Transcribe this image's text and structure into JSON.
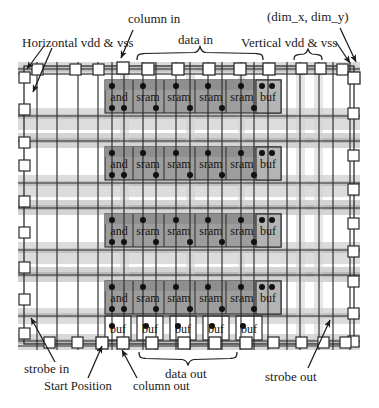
{
  "figure": {
    "kind": "vlsi-tile-array-floorplan",
    "title_visible": false
  },
  "labels": {
    "top_left": "Horizontal vdd & vss",
    "top_center": "column in",
    "top_center2": "data in",
    "top_right_coord": "(dim_x, dim_y)",
    "top_right": "Vertical vdd & vss",
    "bottom_left": "strobe in",
    "bottom_start_position": "Start Position",
    "bottom_column_out": "column out",
    "bottom_data_out": "data out",
    "bottom_right": "strobe out"
  },
  "cells": {
    "row_labels": [
      "and",
      "sram",
      "sram",
      "sram",
      "sram",
      "buf"
    ],
    "buf_row_labels": [
      "buf",
      "buf",
      "buf",
      "buf",
      "buf"
    ],
    "row_count": 4,
    "buf_row_count": 1
  },
  "colors": {
    "band": "#d9d9d9",
    "band_dark": "#b9b9b9",
    "cell_block": "#9a9a9a",
    "cell_block_light": "#ababab",
    "pad_fill": "#ffffff",
    "line": "#2b2b2b",
    "dot": "#111111",
    "text": "#1a1a1a",
    "background": "#ffffff"
  },
  "geometry": {
    "core_x": 18,
    "core_y": 62,
    "core_w": 342,
    "core_h": 288,
    "cell_left": 105,
    "cell_right": 281,
    "row_y": [
      80,
      145,
      212,
      279
    ],
    "buf_row_y": 316
  }
}
